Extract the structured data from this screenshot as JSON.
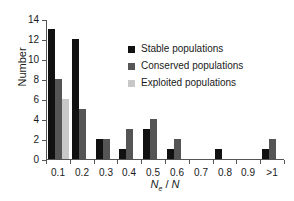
{
  "chart_data": {
    "type": "bar",
    "title": "",
    "xlabel": "Ne / N",
    "xlabel_parts": {
      "base": "N",
      "sub": "e",
      "sep": " / ",
      "denom": "N"
    },
    "ylabel": "Number",
    "categories": [
      "0.1",
      "0.2",
      "0.3",
      "0.4",
      "0.5",
      "0.6",
      "0.7",
      "0.8",
      "0.9",
      ">1"
    ],
    "ylim": [
      0,
      14
    ],
    "yticks": [
      0,
      2,
      4,
      6,
      8,
      10,
      12,
      14
    ],
    "grid": false,
    "legend_position": "upper-right-inside",
    "series": [
      {
        "name": "Stable populations",
        "color": "#111111",
        "values": [
          13,
          12,
          2,
          1,
          3,
          1,
          0,
          1,
          0,
          1
        ]
      },
      {
        "name": "Conserved populations",
        "color": "#555555",
        "values": [
          8,
          5,
          2,
          3,
          4,
          2,
          0,
          0,
          0,
          2
        ]
      },
      {
        "name": "Exploited populations",
        "color": "#c8c8c8",
        "values": [
          6,
          0,
          0,
          0,
          0,
          0,
          0,
          0,
          0,
          0
        ]
      }
    ]
  },
  "legend": {
    "items": [
      {
        "label": "Stable populations",
        "color": "#111111"
      },
      {
        "label": "Conserved populations",
        "color": "#555555"
      },
      {
        "label": "Exploited populations",
        "color": "#c8c8c8"
      }
    ]
  },
  "colors": {
    "axis": "#555555",
    "text": "#1a1a1a",
    "background": "#ffffff"
  }
}
